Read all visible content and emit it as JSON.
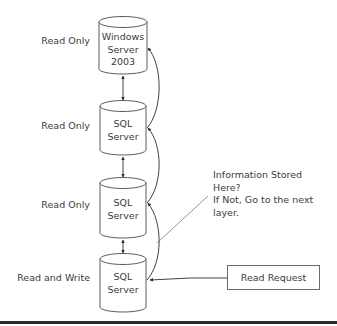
{
  "diagram": {
    "layers": [
      {
        "role": "Read Only",
        "server_lines": [
          "Windows",
          "Server",
          "2003"
        ]
      },
      {
        "role": "Read Only",
        "server_lines": [
          "SQL",
          "Server"
        ]
      },
      {
        "role": "Read Only",
        "server_lines": [
          "SQL",
          "Server"
        ]
      },
      {
        "role": "Read and Write",
        "server_lines": [
          "SQL",
          "Server"
        ]
      }
    ],
    "note_lines": [
      "Information Stored",
      "Here?",
      "If Not, Go to the next",
      "layer."
    ],
    "request_box": {
      "label": "Read Request"
    },
    "colors": {
      "stroke": "#4a4a4a",
      "text": "#3c3c3c",
      "rule": "#2b2b2b"
    }
  }
}
